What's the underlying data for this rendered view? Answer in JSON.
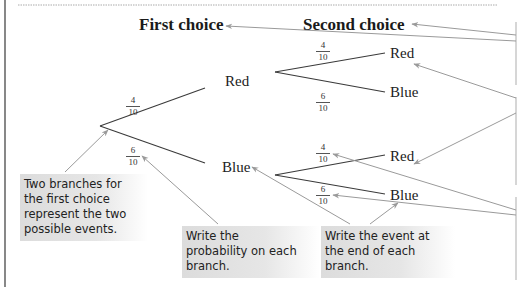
{
  "colors": {
    "line": "#3a3a3a",
    "arrow": "#9a9a9a",
    "callout_bg": "#dedede",
    "border": "#555555"
  },
  "headings": {
    "first_choice": "First choice",
    "second_choice": "Second choice"
  },
  "tree": {
    "first_level": [
      {
        "event": "Red",
        "probability": {
          "numerator": "4",
          "denominator": "10"
        }
      },
      {
        "event": "Blue",
        "probability": {
          "numerator": "6",
          "denominator": "10"
        }
      }
    ],
    "second_level_after_red": [
      {
        "event": "Red",
        "probability": {
          "numerator": "4",
          "denominator": "10"
        }
      },
      {
        "event": "Blue",
        "probability": {
          "numerator": "6",
          "denominator": "10"
        }
      }
    ],
    "second_level_after_blue": [
      {
        "event": "Red",
        "probability": {
          "numerator": "4",
          "denominator": "10"
        }
      },
      {
        "event": "Blue",
        "probability": {
          "numerator": "6",
          "denominator": "10"
        }
      }
    ]
  },
  "callouts": {
    "branches": "Two branches for the first choice represent the two possible events.",
    "probability": "Write the probability on each branch.",
    "event": "Write the event at the end of each branch."
  },
  "callout_lines": {
    "branches": [
      "Two branches for",
      "the first choice",
      "represent the two",
      "possible events."
    ],
    "probability": [
      "Write the",
      "probability on each",
      "branch."
    ],
    "event": [
      "Write the event at",
      "the end of each",
      "branch."
    ]
  }
}
